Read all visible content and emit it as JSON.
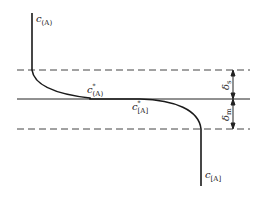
{
  "diagram": {
    "type": "concentration-profile",
    "labels": {
      "bulk_phase1": {
        "base": "c",
        "sub": "(A)"
      },
      "interface_phase1": {
        "base": "c",
        "sup": "*",
        "sub": "(A)"
      },
      "interface_phase2": {
        "base": "c",
        "sup": "*",
        "sub": "[A]"
      },
      "bulk_phase2": {
        "base": "c",
        "sub": "[A]"
      },
      "film_upper": {
        "base": "δ",
        "sub": "s"
      },
      "film_lower": {
        "base": "δ",
        "sub": "m"
      }
    },
    "lines": {
      "upper_boundary": "dashed",
      "interface": "solid",
      "lower_boundary": "dashed"
    },
    "colors": {
      "stroke": "#1a1a1a",
      "dash": "#444444",
      "background": "#ffffff"
    }
  }
}
